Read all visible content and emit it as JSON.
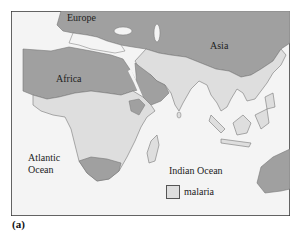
{
  "map": {
    "labels": {
      "europe": "Europe",
      "asia": "Asia",
      "africa": "Africa",
      "atlantic": "Atlantic\nOcean",
      "atlantic_line1": "Atlantic",
      "atlantic_line2": "Ocean",
      "indian": "Indian Ocean"
    },
    "legend": {
      "label": "malaria",
      "swatch_color": "#dedede"
    },
    "colors": {
      "sea": "#f4f4f4",
      "land": "#a0a0a0",
      "malaria": "#dedede",
      "coast": "#777777",
      "frame": "#333333"
    }
  },
  "caption": "(a)"
}
